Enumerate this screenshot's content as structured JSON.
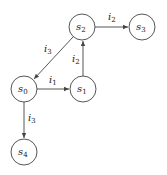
{
  "diagram": {
    "type": "state-transition-graph",
    "nodes": [
      {
        "id": "s0",
        "base": "s",
        "sub": "0",
        "cx": 24,
        "cy": 89
      },
      {
        "id": "s1",
        "base": "s",
        "sub": "1",
        "cx": 83,
        "cy": 89
      },
      {
        "id": "s2",
        "base": "s",
        "sub": "2",
        "cx": 82,
        "cy": 27
      },
      {
        "id": "s3",
        "base": "s",
        "sub": "3",
        "cx": 142,
        "cy": 27
      },
      {
        "id": "s4",
        "base": "s",
        "sub": "4",
        "cx": 24,
        "cy": 152
      }
    ],
    "edges": [
      {
        "from": "s0",
        "to": "s1",
        "label_base": "i",
        "label_sub": "1"
      },
      {
        "from": "s1",
        "to": "s2",
        "label_base": "i",
        "label_sub": "2"
      },
      {
        "from": "s2",
        "to": "s3",
        "label_base": "i",
        "label_sub": "2"
      },
      {
        "from": "s2",
        "to": "s0",
        "label_base": "i",
        "label_sub": "3"
      },
      {
        "from": "s0",
        "to": "s4",
        "label_base": "i",
        "label_sub": "3"
      }
    ],
    "colors": {
      "stroke": "#444444",
      "text": "#222222",
      "background": "#ffffff"
    }
  }
}
